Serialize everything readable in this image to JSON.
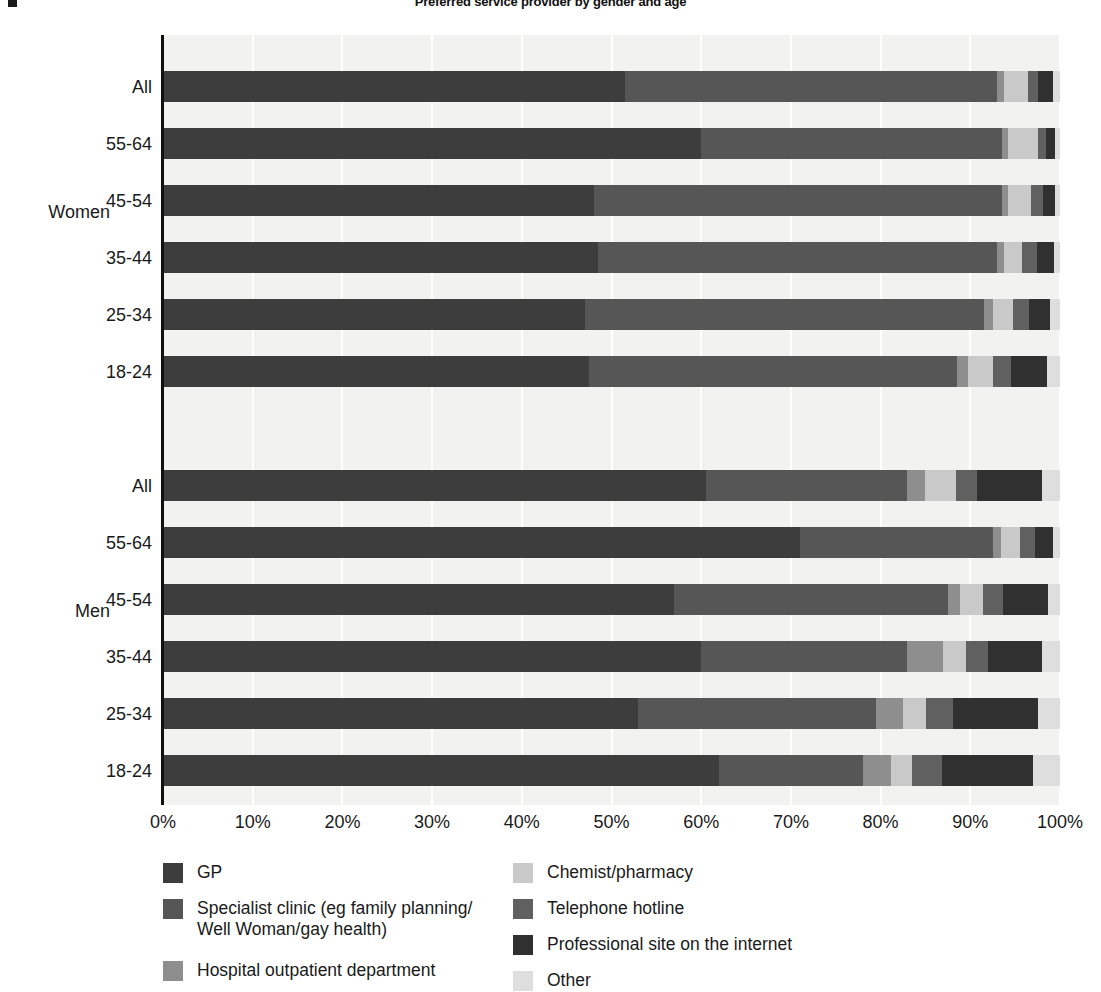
{
  "title": "Preferred service provider by gender and age",
  "axis": {
    "x_ticks": [
      "0%",
      "10%",
      "20%",
      "30%",
      "40%",
      "50%",
      "60%",
      "70%",
      "80%",
      "90%",
      "100%"
    ],
    "xlabel": "",
    "ylabel": ""
  },
  "groups": [
    {
      "name": "Women",
      "label": "Women"
    },
    {
      "name": "Men",
      "label": "Men"
    }
  ],
  "legend": {
    "left": [
      {
        "label": "GP",
        "color": "#3d3d3d",
        "key": "gp"
      },
      {
        "label": "Specialist clinic (eg family planning/\nWell Woman/gay health)",
        "color": "#565656",
        "key": "specialist"
      },
      {
        "label": "Hospital outpatient department",
        "color": "#8e8e8e",
        "key": "hospital"
      }
    ],
    "right": [
      {
        "label": "Chemist/pharmacy",
        "color": "#c9c9c9",
        "key": "chemist"
      },
      {
        "label": "Telephone  hotline",
        "color": "#606060",
        "key": "telephone"
      },
      {
        "label": "Professional site on the internet",
        "color": "#303030",
        "key": "internet"
      },
      {
        "label": "Other",
        "color": "#dedede",
        "key": "other"
      }
    ]
  },
  "chart_data": {
    "type": "bar",
    "orientation": "horizontal",
    "stacked": true,
    "normalized": "100%",
    "title": "Preferred service provider by gender and age",
    "xlabel": "",
    "ylabel": "",
    "xlim": [
      0,
      100
    ],
    "xticks": [
      0,
      10,
      20,
      30,
      40,
      50,
      60,
      70,
      80,
      90,
      100
    ],
    "grid": "vertical",
    "legend_position": "bottom",
    "series": [
      {
        "name": "GP",
        "color": "#3d3d3d"
      },
      {
        "name": "Specialist clinic (eg family planning/Well Woman/gay health)",
        "color": "#565656"
      },
      {
        "name": "Hospital outpatient department",
        "color": "#8e8e8e"
      },
      {
        "name": "Chemist/pharmacy",
        "color": "#c9c9c9"
      },
      {
        "name": "Telephone  hotline",
        "color": "#606060"
      },
      {
        "name": "Professional site on the internet",
        "color": "#303030"
      },
      {
        "name": "Other",
        "color": "#dedede"
      }
    ],
    "groups": [
      {
        "group": "Women",
        "categories": [
          "All",
          "55-64",
          "45-54",
          "35-44",
          "25-34",
          "18-24"
        ],
        "rows": [
          {
            "category": "All",
            "values": [
              51.5,
              41.5,
              0.8,
              2.6,
              1.1,
              1.7,
              0.8
            ]
          },
          {
            "category": "55-64",
            "values": [
              60.0,
              33.5,
              0.7,
              3.4,
              0.8,
              1.0,
              0.6
            ]
          },
          {
            "category": "45-54",
            "values": [
              48.0,
              45.5,
              0.7,
              2.6,
              1.3,
              1.4,
              0.5
            ]
          },
          {
            "category": "35-44",
            "values": [
              48.5,
              44.5,
              0.8,
              2.0,
              1.6,
              1.9,
              0.7
            ]
          },
          {
            "category": "25-34",
            "values": [
              47.0,
              44.5,
              1.0,
              2.3,
              1.8,
              2.3,
              1.1
            ]
          },
          {
            "category": "18-24",
            "values": [
              47.5,
              41.0,
              1.2,
              2.8,
              2.0,
              4.0,
              1.5
            ]
          }
        ]
      },
      {
        "group": "Men",
        "categories": [
          "All",
          "55-64",
          "45-54",
          "35-44",
          "25-34",
          "18-24"
        ],
        "rows": [
          {
            "category": "All",
            "values": [
              60.5,
              22.5,
              2.0,
              3.4,
              2.3,
              7.3,
              2.0
            ]
          },
          {
            "category": "55-64",
            "values": [
              71.0,
              21.5,
              0.9,
              2.2,
              1.6,
              2.0,
              0.8
            ]
          },
          {
            "category": "45-54",
            "values": [
              57.0,
              30.5,
              1.4,
              2.5,
              2.3,
              5.0,
              1.3
            ]
          },
          {
            "category": "35-44",
            "values": [
              60.0,
              23.0,
              4.0,
              2.5,
              2.5,
              6.0,
              2.0
            ]
          },
          {
            "category": "25-34",
            "values": [
              53.0,
              26.5,
              3.0,
              2.6,
              3.0,
              9.5,
              2.4
            ]
          },
          {
            "category": "18-24",
            "values": [
              62.0,
              16.0,
              3.2,
              2.3,
              3.4,
              10.1,
              3.0
            ]
          }
        ]
      }
    ]
  },
  "layout": {
    "row_tops": {
      "women": [
        71,
        128,
        185,
        242,
        299,
        356
      ],
      "men": [
        470,
        527,
        584,
        641,
        698,
        755
      ]
    },
    "group_label_tops": {
      "women": 203,
      "men": 602
    },
    "plot": {
      "left": 163,
      "top": 35,
      "width": 897,
      "height": 770
    }
  }
}
